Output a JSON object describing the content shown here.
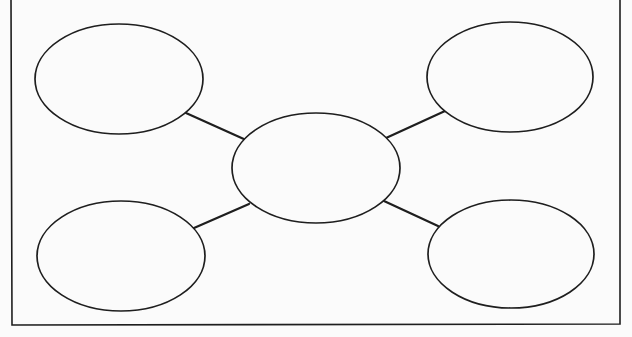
{
  "diagram": {
    "type": "concept-map",
    "width": 632,
    "height": 337,
    "background": "#fbfbfb",
    "stroke_color": "#1e1e1e",
    "frame": {
      "x1": 11,
      "y1": -2,
      "x2": 620,
      "y2": 325,
      "stroke_width": 1.6
    },
    "center_node": {
      "id": "center",
      "cx": 316,
      "cy": 168,
      "rx": 84,
      "ry": 55,
      "label": ""
    },
    "nodes": [
      {
        "id": "top-left",
        "cx": 119,
        "cy": 79,
        "rx": 84,
        "ry": 55,
        "label": ""
      },
      {
        "id": "top-right",
        "cx": 510,
        "cy": 77,
        "rx": 83,
        "ry": 55,
        "label": ""
      },
      {
        "id": "bottom-left",
        "cx": 121,
        "cy": 256,
        "rx": 84,
        "ry": 55,
        "label": ""
      },
      {
        "id": "bottom-right",
        "cx": 511,
        "cy": 254,
        "rx": 83,
        "ry": 54,
        "label": ""
      }
    ],
    "edges": [
      {
        "from": "top-left",
        "to": "center",
        "x1": 186,
        "y1": 113,
        "x2": 246,
        "y2": 140
      },
      {
        "from": "top-right",
        "to": "center",
        "x1": 445,
        "y1": 111,
        "x2": 386,
        "y2": 138
      },
      {
        "from": "bottom-left",
        "to": "center",
        "x1": 194,
        "y1": 228,
        "x2": 249,
        "y2": 204
      },
      {
        "from": "bottom-right",
        "to": "center",
        "x1": 438,
        "y1": 226,
        "x2": 384,
        "y2": 201
      }
    ]
  }
}
